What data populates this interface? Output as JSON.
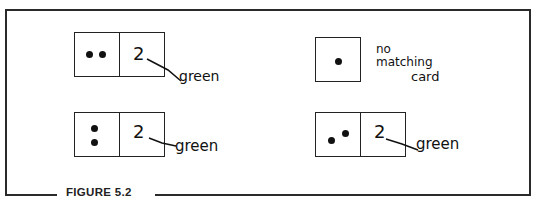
{
  "figure": {
    "caption": "FIGURE 5.2",
    "examples": [
      {
        "position": "top-left",
        "left_card": {
          "dots": 2,
          "arrangement": "horizontal"
        },
        "right_card": {
          "number": "2"
        },
        "label": "green"
      },
      {
        "position": "top-right",
        "single_card": {
          "dots": 1
        },
        "label_lines": [
          "no",
          "matching",
          "card"
        ]
      },
      {
        "position": "bottom-left",
        "left_card": {
          "dots": 2,
          "arrangement": "vertical"
        },
        "right_card": {
          "number": "2"
        },
        "label": "green"
      },
      {
        "position": "bottom-right",
        "left_card": {
          "dots": 2,
          "arrangement": "diagonal"
        },
        "right_card": {
          "number": "2"
        },
        "label": "green"
      }
    ]
  }
}
